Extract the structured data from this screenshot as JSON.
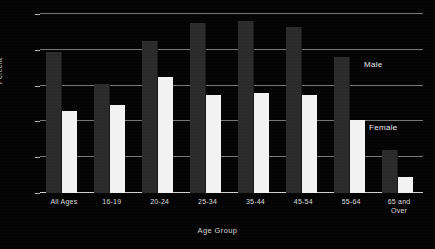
{
  "chart_data": {
    "type": "bar",
    "title": "",
    "xlabel": "Age Group",
    "ylabel": "Percent",
    "categories": [
      "All Ages",
      "16-19",
      "20-24",
      "25-34",
      "35-44",
      "45-54",
      "55-64",
      "65 and\nOver"
    ],
    "series": [
      {
        "name": "Male",
        "values": [
          79,
          61,
          85,
          95,
          96,
          93,
          76,
          24
        ],
        "color": "#2b2b2b"
      },
      {
        "name": "Female",
        "values": [
          46,
          49,
          65,
          55,
          56,
          55,
          41,
          9
        ],
        "color": "#f2f2f2"
      }
    ],
    "ylim": [
      0,
      100
    ],
    "yticks": [
      0,
      20,
      40,
      60,
      80,
      100
    ],
    "ytick_labels": [
      "0",
      "20",
      "40",
      "60",
      "80",
      "100"
    ],
    "grid": true,
    "legend_position": "inline-annotation",
    "annotations": [
      {
        "text": "Male",
        "x": 364,
        "y": 60
      },
      {
        "text": "Female",
        "x": 369,
        "y": 123
      }
    ]
  },
  "axis": {
    "y_title": "Percent",
    "x_title": "Age Group"
  },
  "annotations": {
    "male_label": "Male",
    "female_label": "Female"
  },
  "colors": {
    "background": "#040404",
    "male_bar": "#2b2b2b",
    "female_bar": "#f2f2f2",
    "gridline": "#8d8d8d",
    "text": "#dcdcdc"
  }
}
